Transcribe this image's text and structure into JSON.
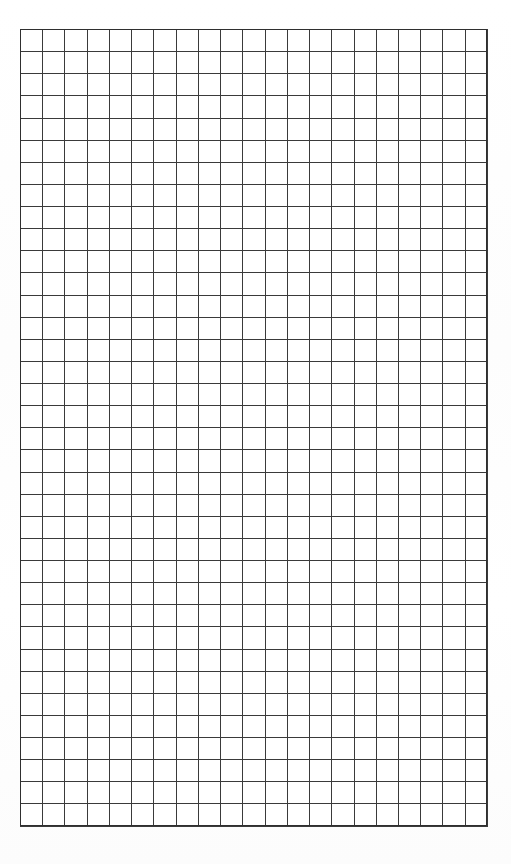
{
  "document": {
    "kind": "blank-grid-sheet",
    "title": "Blank Grid Sheet",
    "page_width": 511,
    "page_height": 864,
    "background_color": "#ffffff",
    "has_text": false,
    "visible_text": []
  },
  "grid": {
    "name": "graph-paper-grid",
    "columns": 21,
    "rows": 36,
    "cell_width": 22.24,
    "cell_height": 22.14,
    "origin_x": 20,
    "origin_y": 29,
    "width": 467,
    "height": 797,
    "line_color": "#3a3a3a",
    "outer_border_color": "#2f2f2f",
    "line_width": 1,
    "cell_fill": "#ffffff",
    "cells_filled": 0,
    "cell_contents": []
  },
  "margins": {
    "top": 29,
    "left": 20,
    "right": 24,
    "bottom": 38
  }
}
